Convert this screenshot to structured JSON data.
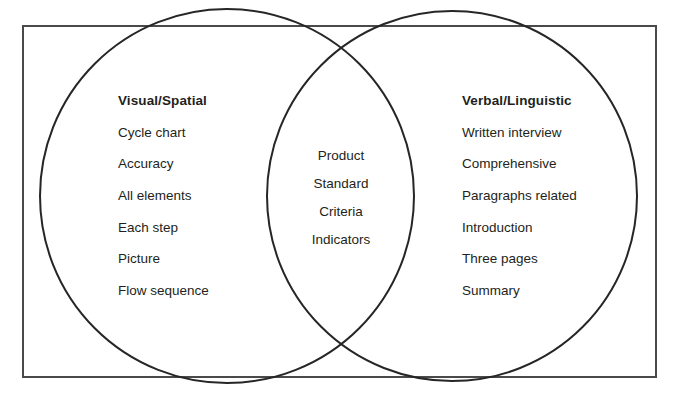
{
  "diagram": {
    "type": "venn-diagram",
    "frame": {
      "border_color": "#4a4a4a"
    },
    "circle_stroke_color": "#262626",
    "left": {
      "heading": "Visual/Spatial",
      "items": [
        "Cycle chart",
        "Accuracy",
        "All elements",
        "Each step",
        "Picture",
        "Flow sequence"
      ]
    },
    "right": {
      "heading": "Verbal/Linguistic",
      "items": [
        "Written interview",
        "Comprehensive",
        "Paragraphs related",
        "Introduction",
        "Three pages",
        "Summary"
      ]
    },
    "center": {
      "items": [
        "Product",
        "Standard",
        "Criteria",
        "Indicators"
      ]
    }
  }
}
